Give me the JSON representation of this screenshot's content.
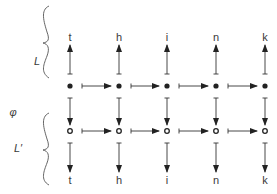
{
  "diagram": {
    "layers": [
      {
        "id": "L",
        "label": "L"
      },
      {
        "id": "phi",
        "label": "φ"
      },
      {
        "id": "Lprime",
        "label": "L′"
      }
    ],
    "top_letters": [
      "t",
      "h",
      "i",
      "n",
      "k"
    ],
    "bottom_letters": [
      "t",
      "h",
      "i",
      "n",
      "k"
    ],
    "top_row": {
      "node_style": "filled-dot",
      "arrows_to_letters": "up"
    },
    "bottom_row": {
      "node_style": "open-circle",
      "arrows_to_letters": "down"
    },
    "horizontal_arrows": "right, between adjacent nodes in each row",
    "vertical_maps": "down, from each filled node to corresponding open node (φ)",
    "colors": {
      "ink": "#333333",
      "background": "#ffffff"
    }
  }
}
